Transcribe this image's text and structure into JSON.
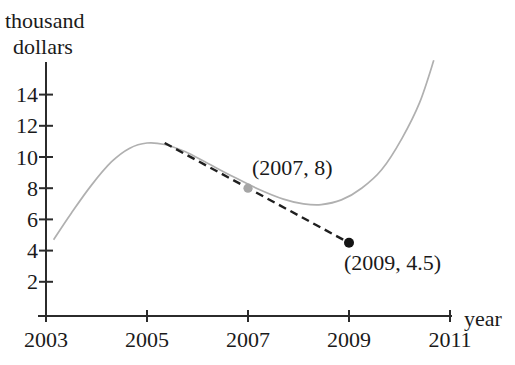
{
  "figure": {
    "background": "#ffffff",
    "y_axis_title_line1": "thousand",
    "y_axis_title_line2": "dollars",
    "x_axis_title": "year"
  },
  "chart_data": {
    "type": "line",
    "title": "",
    "xlabel": "year",
    "ylabel": "thousand dollars",
    "grid": false,
    "legend": "none",
    "xlim": [
      2003,
      2011
    ],
    "ylim": [
      0,
      16
    ],
    "x_ticks": [
      "2003",
      "2005",
      "2007",
      "2009",
      "2011"
    ],
    "x_tick_values": [
      2003,
      2005,
      2007,
      2009,
      2011
    ],
    "y_ticks": [
      "2",
      "4",
      "6",
      "8",
      "10",
      "12",
      "14"
    ],
    "y_tick_values": [
      2,
      4,
      6,
      8,
      10,
      12,
      14
    ],
    "series": [
      {
        "name": "amount-curve",
        "type": "smooth-line",
        "color": "#b0b0b0",
        "points": [
          [
            2003.15,
            4.7
          ],
          [
            2003.5,
            6.4
          ],
          [
            2003.9,
            8.2
          ],
          [
            2004.3,
            9.7
          ],
          [
            2004.65,
            10.55
          ],
          [
            2005.0,
            10.9
          ],
          [
            2005.35,
            10.8
          ],
          [
            2005.75,
            10.35
          ],
          [
            2006.2,
            9.6
          ],
          [
            2006.7,
            8.75
          ],
          [
            2007.2,
            7.95
          ],
          [
            2007.7,
            7.3
          ],
          [
            2008.1,
            7.0
          ],
          [
            2008.45,
            6.95
          ],
          [
            2008.85,
            7.25
          ],
          [
            2009.25,
            8.0
          ],
          [
            2009.65,
            9.2
          ],
          [
            2010.05,
            11.2
          ],
          [
            2010.4,
            13.5
          ],
          [
            2010.68,
            16.2
          ]
        ]
      }
    ],
    "secant_line": {
      "name": "dashed-line-through-labeled-points",
      "style": "dashed",
      "color": "#1f1f1f",
      "from": [
        2005.35,
        10.9
      ],
      "to": [
        2009,
        4.5
      ]
    },
    "labeled_points": [
      {
        "x": 2007,
        "y": 8,
        "label": "(2007, 8)",
        "marker_color": "#a6a6a6"
      },
      {
        "x": 2009,
        "y": 4.5,
        "label": "(2009, 4.5)",
        "marker_color": "#141414"
      }
    ],
    "colors": {
      "axis": "#2b2b2b",
      "text": "#1a1a1a"
    }
  }
}
